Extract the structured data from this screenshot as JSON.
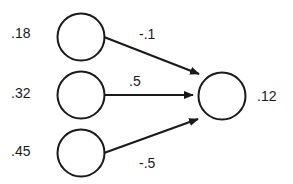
{
  "diagram": {
    "type": "neural-network-unit",
    "colors": {
      "stroke": "#1a1a1a",
      "background": "#ffffff",
      "node_fill": "#ffffff"
    },
    "input_nodes": [
      {
        "id": "in1",
        "activation": ".18",
        "cx": 81,
        "cy": 37,
        "r": 24
      },
      {
        "id": "in2",
        "activation": ".32",
        "cx": 81,
        "cy": 95,
        "r": 24
      },
      {
        "id": "in3",
        "activation": ".45",
        "cx": 81,
        "cy": 153,
        "r": 24
      }
    ],
    "output_node": {
      "id": "out",
      "activation": ".12",
      "cx": 222,
      "cy": 96,
      "r": 24
    },
    "connections": [
      {
        "from": "in1",
        "to": "out",
        "weight": "-.1"
      },
      {
        "from": "in2",
        "to": "out",
        "weight": ".5"
      },
      {
        "from": "in3",
        "to": "out",
        "weight": "-.5"
      }
    ]
  }
}
